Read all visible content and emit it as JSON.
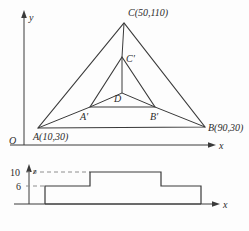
{
  "figure": {
    "title_visible": false,
    "colors": {
      "stroke": "#3a3a3a",
      "dashed": "#8e8e8e",
      "background": "#fdfdfd",
      "text": "#2b2b2b"
    },
    "top_view": {
      "axes": {
        "x_label": "x",
        "y_label": "y",
        "origin_label": "O"
      },
      "outer_triangle": {
        "vertices": [
          {
            "name": "A",
            "label": "A(10,30)",
            "coord_text": "(10,30)",
            "data_x": 10,
            "data_y": 30
          },
          {
            "name": "B",
            "label": "B(90,30)",
            "coord_text": "(90,30)",
            "data_x": 90,
            "data_y": 30
          },
          {
            "name": "C",
            "label": "C(50,110)",
            "coord_text": "(50,110)",
            "data_x": 50,
            "data_y": 110
          }
        ]
      },
      "inner_triangle": {
        "vertices": [
          {
            "name": "A'",
            "label": "A′"
          },
          {
            "name": "B'",
            "label": "B′"
          },
          {
            "name": "C'",
            "label": "C′"
          }
        ],
        "centroid": {
          "name": "D",
          "label": "D"
        }
      }
    },
    "side_view": {
      "axes": {
        "x_label": "x",
        "z_label": "z"
      },
      "tick_labels": [
        {
          "value": "10",
          "level": 10
        },
        {
          "value": "6",
          "level": 6
        }
      ],
      "steps": [
        {
          "name": "base-slab",
          "height": 6
        },
        {
          "name": "top-slab",
          "height": 10
        }
      ]
    }
  }
}
